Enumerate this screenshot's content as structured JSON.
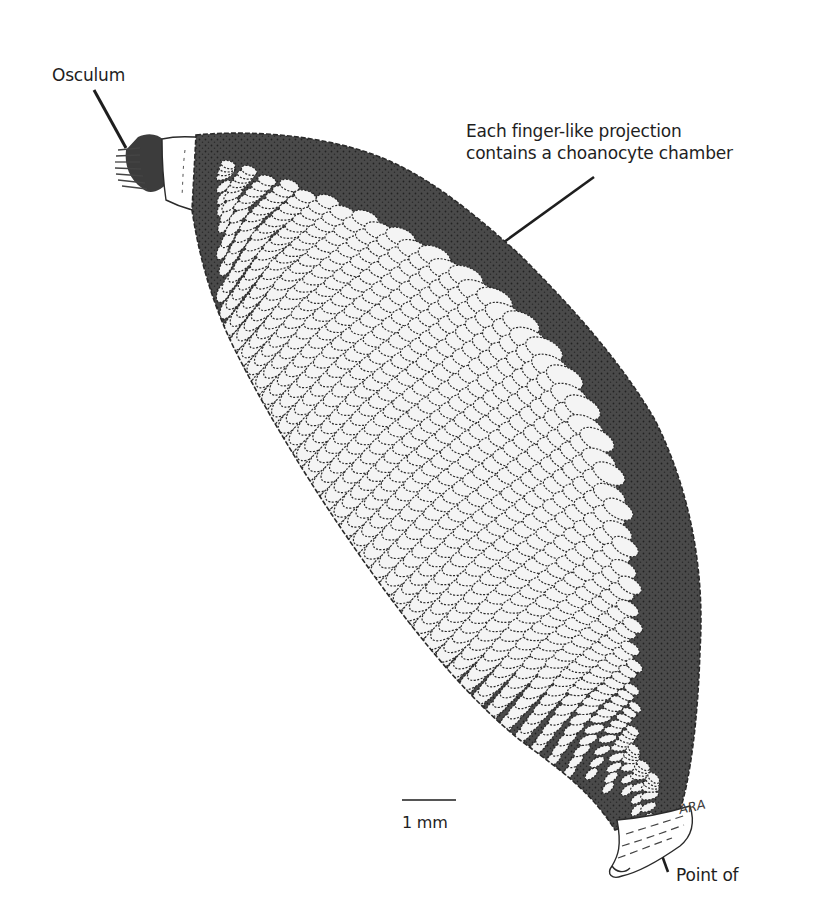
{
  "figure": {
    "labels": {
      "osculum": "Osculum",
      "finger_line1": "Each finger-like projection",
      "finger_line2": "contains a choanocyte chamber",
      "point_of": "Point of"
    },
    "scale_bar": {
      "text": "1 mm"
    },
    "signature": "ARA",
    "colors": {
      "ink": "#1e1e1e",
      "background": "#ffffff",
      "chamber_fill": "#f4f4f4",
      "shadow": "#3a3a3a"
    }
  }
}
